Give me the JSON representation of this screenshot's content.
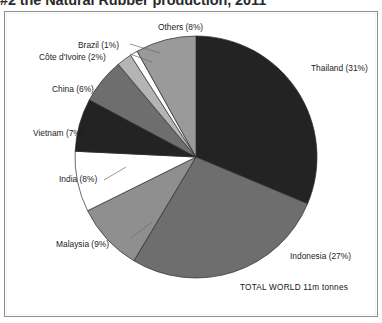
{
  "title": "#2 the Natural Rubber production, 2011",
  "annotation": "TOTAL WORLD 11m tonnes",
  "chart_data": {
    "type": "pie",
    "title": "#2 the Natural Rubber production, 2011",
    "unit": "percent of world production",
    "total_label": "TOTAL WORLD 11m tonnes",
    "total_value": "11m tonnes",
    "legend_position": "callout-labels",
    "grid": false,
    "categories": [
      "Thailand",
      "Indonesia",
      "Malaysia",
      "India",
      "Vietnam",
      "China",
      "Côte d'Ivoire",
      "Brazil",
      "Others"
    ],
    "values": [
      31,
      27,
      9,
      8,
      7,
      6,
      2,
      1,
      8
    ],
    "labels": [
      "Thailand (31%)",
      "Indonesia (27%)",
      "Malaysia (9%)",
      "India (8%)",
      "Vietnam (7%)",
      "China (6%)",
      "Côte d'Ivoire (2%)",
      "Brazil (1%)",
      "Others (8%)"
    ],
    "colors": [
      "#232323",
      "#6e6e6e",
      "#8f8f8f",
      "#ffffff",
      "#232323",
      "#6e6e6e",
      "#b4b4b4",
      "#ffffff",
      "#9a9a9a"
    ],
    "start_angle": 0,
    "direction": "clockwise"
  }
}
